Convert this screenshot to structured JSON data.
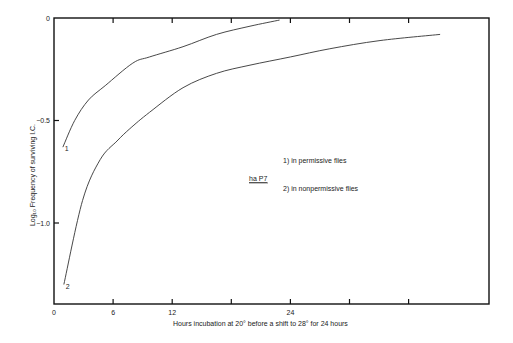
{
  "chart_data": {
    "type": "line",
    "title": "",
    "xlabel": "Hours incubation at 20° before a shift to 28° for 24 hours",
    "ylabel": "Log₁₀ Frequency of surviving I.C.",
    "xlim": [
      0,
      44.2
    ],
    "ylim": [
      -1.395,
      0
    ],
    "x_ticks": [
      {
        "value": 0,
        "label": "0"
      },
      {
        "value": 6,
        "label": "6"
      },
      {
        "value": 12,
        "label": "12"
      },
      {
        "value": 18,
        "label": ""
      },
      {
        "value": 24,
        "label": "24"
      },
      {
        "value": 30,
        "label": ""
      },
      {
        "value": 36,
        "label": ""
      }
    ],
    "y_ticks": [
      {
        "value": 0,
        "label": "0"
      },
      {
        "value": -0.5,
        "label": "-0.5"
      },
      {
        "value": -1.0,
        "label": "-1.0"
      }
    ],
    "grid": false,
    "legend": {
      "strain": "ha P7",
      "entries": [
        "1)  in permissive flies",
        "2)  in nonpermissive flies"
      ]
    },
    "series": [
      {
        "name": "1",
        "label": "in permissive flies",
        "x": [
          0.9,
          2.1,
          3.5,
          5.2,
          8.0,
          9.7,
          13.1,
          16.5,
          19.9,
          22.9
        ],
        "y": [
          -0.63,
          -0.5,
          -0.4,
          -0.33,
          -0.22,
          -0.19,
          -0.14,
          -0.08,
          -0.04,
          -0.01
        ]
      },
      {
        "name": "2",
        "label": "in nonpermissive flies",
        "x": [
          1.0,
          2.9,
          4.7,
          6.4,
          7.7,
          9.7,
          13.1,
          16.5,
          19.9,
          24.0,
          28.0,
          33.1,
          39.2
        ],
        "y": [
          -1.3,
          -0.89,
          -0.69,
          -0.6,
          -0.54,
          -0.46,
          -0.34,
          -0.27,
          -0.23,
          -0.19,
          -0.15,
          -0.11,
          -0.08
        ]
      }
    ]
  },
  "plot": {
    "left": 54,
    "right": 489,
    "top": 18,
    "bottom": 304,
    "px_per_hour": 9.85,
    "px_per_unit": 205
  },
  "colors": {
    "axis": "#111111",
    "curve": "#333333"
  }
}
